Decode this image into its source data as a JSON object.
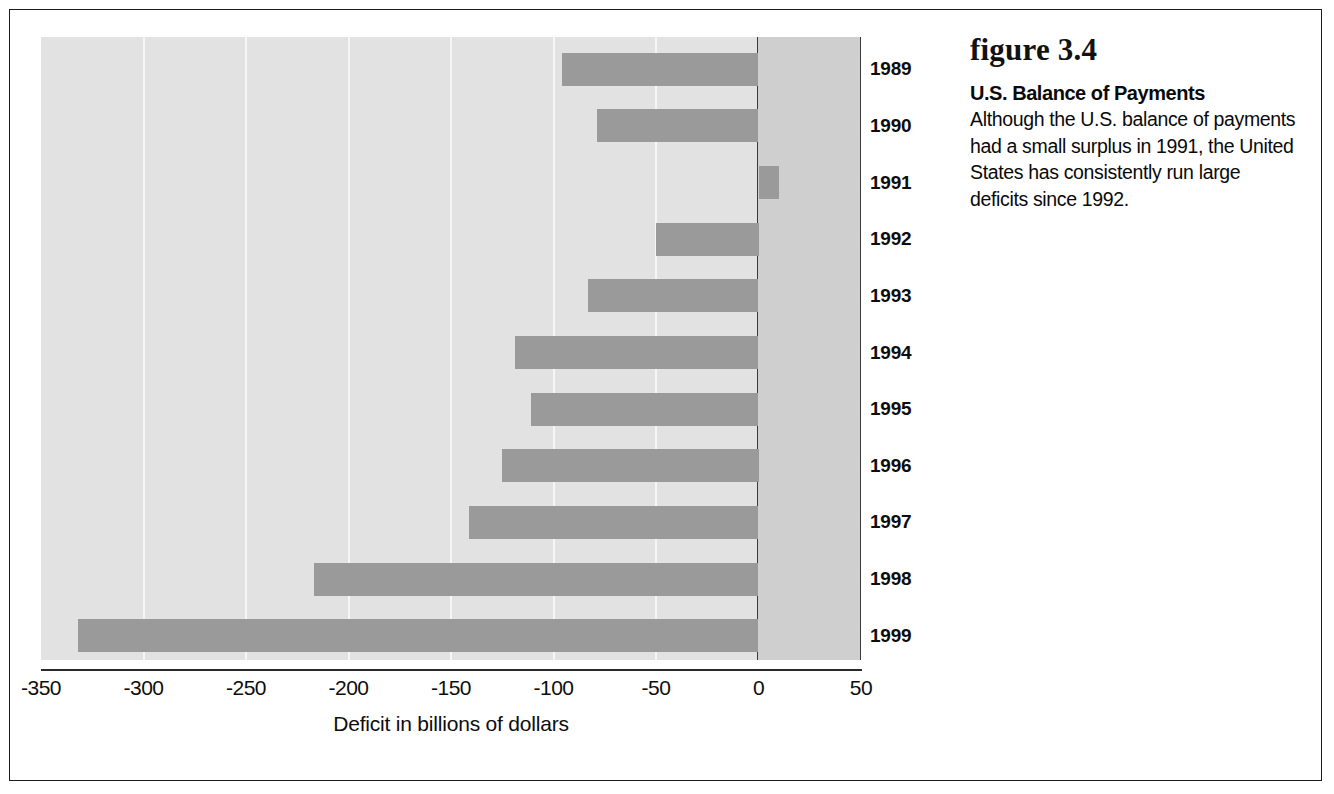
{
  "figure": {
    "number_label": "figure 3.4",
    "title": "U.S. Balance of Payments",
    "body": "Although the U.S. balance of payments had a small surplus in 1991, the United States has consistently run large deficits since 1992."
  },
  "chart_data": {
    "type": "bar",
    "orientation": "horizontal",
    "title": "U.S. Balance of Payments",
    "xlabel": "Deficit in billions of dollars",
    "ylabel": "",
    "categories": [
      "1989",
      "1990",
      "1991",
      "1992",
      "1993",
      "1994",
      "1995",
      "1996",
      "1997",
      "1998",
      "1999"
    ],
    "values": [
      -96,
      -79,
      10,
      -50,
      -83,
      -119,
      -111,
      -125,
      -141,
      -217,
      -332
    ],
    "xlim": [
      -350,
      50
    ],
    "xticks": [
      -350,
      -300,
      -250,
      -200,
      -150,
      -100,
      -50,
      0,
      50
    ],
    "xtick_labels": [
      "-350",
      "-300",
      "-250",
      "-200",
      "-150",
      "-100",
      "-50",
      "0",
      "50"
    ],
    "grid": true,
    "grid_axis": "x",
    "legend": false,
    "series": [
      {
        "name": "Balance of payments",
        "values": [
          -96,
          -79,
          10,
          -50,
          -83,
          -119,
          -111,
          -125,
          -141,
          -217,
          -332
        ]
      }
    ],
    "colors": {
      "bar": "#9a9a9a",
      "bar_shadow": "#7d7d7d",
      "plot_background": "#e2e2e2",
      "positive_zone_background": "#cfcfcf",
      "gridline": "#f6f6f6",
      "axis": "#2a2a2a",
      "text": "#0d0d0d"
    }
  }
}
